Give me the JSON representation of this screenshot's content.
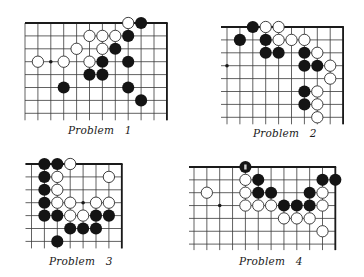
{
  "colors": {
    "line": "#3a3a3a",
    "edge": "#1a1a1a",
    "black_stone": "#141414",
    "white_stone_fill": "#ffffff",
    "white_stone_stroke": "#2a2a2a",
    "background": "#ffffff"
  },
  "problems": [
    {
      "caption": "Problem   1",
      "caption_pos": [
        68,
        124
      ],
      "origin": [
        25,
        23
      ],
      "spacing": 12.9,
      "cols": 12,
      "rows": 8,
      "extend_bottom": 7,
      "extend_left": 0,
      "edges": {
        "top": true,
        "right": true,
        "left": false,
        "bottom": false
      },
      "hoshi": [
        [
          2,
          3
        ]
      ],
      "black": [
        [
          9,
          0
        ],
        [
          8,
          1
        ],
        [
          7,
          2
        ],
        [
          6,
          3
        ],
        [
          8,
          3
        ],
        [
          5,
          4
        ],
        [
          6,
          4
        ],
        [
          3,
          5
        ],
        [
          8,
          5
        ],
        [
          9,
          6
        ]
      ],
      "white": [
        [
          8,
          0
        ],
        [
          5,
          1
        ],
        [
          6,
          1
        ],
        [
          7,
          1
        ],
        [
          4,
          2
        ],
        [
          6,
          2
        ],
        [
          1,
          3
        ],
        [
          3,
          3
        ],
        [
          5,
          3
        ]
      ],
      "marked": []
    },
    {
      "caption": "Problem   2",
      "caption_pos": [
        253,
        127
      ],
      "origin": [
        227,
        27
      ],
      "spacing": 12.9,
      "cols": 10,
      "rows": 8,
      "extend_bottom": 7,
      "extend_left": 6,
      "edges": {
        "top": true,
        "right": true,
        "left": false,
        "bottom": false
      },
      "hoshi": [
        [
          0,
          3
        ]
      ],
      "black": [
        [
          2,
          0
        ],
        [
          1,
          1
        ],
        [
          3,
          1
        ],
        [
          3,
          2
        ],
        [
          4,
          2
        ],
        [
          6,
          2
        ],
        [
          6,
          3
        ],
        [
          7,
          3
        ],
        [
          6,
          5
        ],
        [
          6,
          6
        ]
      ],
      "white": [
        [
          3,
          0
        ],
        [
          4,
          0
        ],
        [
          4,
          1
        ],
        [
          5,
          1
        ],
        [
          6,
          1
        ],
        [
          7,
          2
        ],
        [
          8,
          3
        ],
        [
          8,
          4
        ],
        [
          7,
          5
        ],
        [
          7,
          6
        ],
        [
          7,
          7
        ]
      ],
      "marked": []
    },
    {
      "caption": "Problem   3",
      "caption_pos": [
        49,
        255
      ],
      "origin": [
        31.5,
        164
      ],
      "spacing": 12.9,
      "cols": 8,
      "rows": 7,
      "extend_bottom": 7,
      "extend_left": 6,
      "edges": {
        "top": true,
        "right": true,
        "left": false,
        "bottom": false
      },
      "hoshi": [
        [
          4,
          3
        ]
      ],
      "black": [
        [
          1,
          0
        ],
        [
          2,
          0
        ],
        [
          1,
          1
        ],
        [
          1,
          2
        ],
        [
          1,
          3
        ],
        [
          1,
          4
        ],
        [
          2,
          4
        ],
        [
          5,
          4
        ],
        [
          6,
          4
        ],
        [
          3,
          5
        ],
        [
          4,
          5
        ],
        [
          5,
          5
        ],
        [
          2,
          6
        ]
      ],
      "white": [
        [
          3,
          0
        ],
        [
          2,
          1
        ],
        [
          6,
          1
        ],
        [
          2,
          2
        ],
        [
          2,
          3
        ],
        [
          3,
          3
        ],
        [
          5,
          3
        ],
        [
          6,
          3
        ],
        [
          3,
          4
        ],
        [
          4,
          4
        ]
      ],
      "marked": []
    },
    {
      "caption": "Problem   4",
      "caption_pos": [
        239,
        255
      ],
      "origin": [
        194,
        167
      ],
      "spacing": 12.85,
      "cols": 12,
      "rows": 7,
      "extend_bottom": 6,
      "extend_left": 5,
      "edges": {
        "top": true,
        "right": true,
        "left": false,
        "bottom": false
      },
      "hoshi": [
        [
          2,
          3
        ]
      ],
      "black": [
        [
          4,
          0
        ],
        [
          5,
          1
        ],
        [
          10,
          1
        ],
        [
          11,
          1
        ],
        [
          5,
          2
        ],
        [
          6,
          2
        ],
        [
          9,
          2
        ],
        [
          7,
          3
        ],
        [
          8,
          3
        ],
        [
          9,
          3
        ]
      ],
      "white": [
        [
          4,
          1
        ],
        [
          1,
          2
        ],
        [
          4,
          2
        ],
        [
          10,
          2
        ],
        [
          4,
          3
        ],
        [
          5,
          3
        ],
        [
          6,
          3
        ],
        [
          10,
          3
        ],
        [
          7,
          4
        ],
        [
          8,
          4
        ],
        [
          9,
          4
        ],
        [
          10,
          5
        ]
      ],
      "marked": [
        [
          4,
          0
        ]
      ]
    }
  ]
}
